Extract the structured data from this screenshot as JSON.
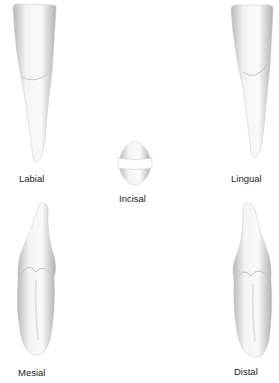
{
  "figure": {
    "views": [
      {
        "id": "labial",
        "label": "Labial"
      },
      {
        "id": "lingual",
        "label": "Lingual"
      },
      {
        "id": "incisal",
        "label": "Incisal"
      },
      {
        "id": "mesial",
        "label": "Mesial"
      },
      {
        "id": "distal",
        "label": "Distal"
      }
    ]
  },
  "colors": {
    "enamel": "#f2f2f2",
    "shade": "#bdbdbd",
    "label": "#222222"
  }
}
